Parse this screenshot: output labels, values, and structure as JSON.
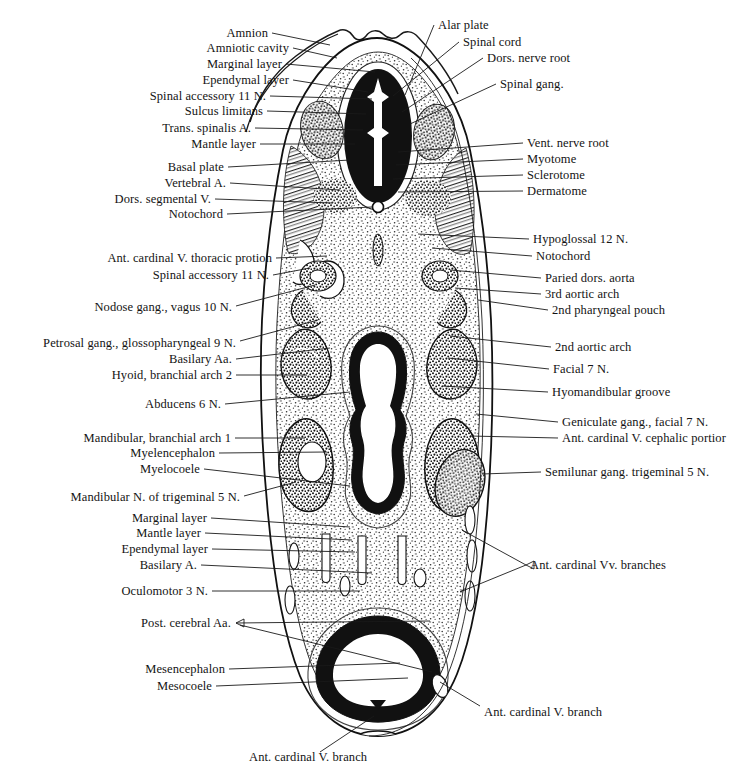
{
  "figure": {
    "type": "anatomical-cross-section",
    "colors": {
      "background": "#ffffff",
      "ink": "#111111",
      "neural_tube_wall": "#151515",
      "mesenchyme_stipple": "#333333"
    }
  },
  "labels": {
    "left": [
      {
        "id": "amnion",
        "text": "Amnion",
        "x": 268,
        "y": 33,
        "lx": 330,
        "ly": 45
      },
      {
        "id": "amniotic-cavity",
        "text": "Amniotic cavity",
        "x": 289,
        "y": 48,
        "lx": 337,
        "ly": 58
      },
      {
        "id": "marginal-layer-1",
        "text": "Marginal layer",
        "x": 282,
        "y": 64,
        "lx": 375,
        "ly": 72
      },
      {
        "id": "ependymal-layer-1",
        "text": "Ependymal layer",
        "x": 289,
        "y": 80,
        "lx": 368,
        "ly": 92
      },
      {
        "id": "spinal-accessory-11n-1",
        "text": "Spinal accessory 11 N.",
        "x": 266,
        "y": 96,
        "lx": 372,
        "ly": 99
      },
      {
        "id": "sulcus-limitans",
        "text": "Sulcus limitans",
        "x": 263,
        "y": 111,
        "lx": 366,
        "ly": 114
      },
      {
        "id": "trans-spinalis-a",
        "text": "Trans. spinalis A.",
        "x": 251,
        "y": 128,
        "lx": 363,
        "ly": 130
      },
      {
        "id": "mantle-layer-1",
        "text": "Mantle layer",
        "x": 256,
        "y": 144,
        "lx": 355,
        "ly": 144
      },
      {
        "id": "basal-plate",
        "text": "Basal plate",
        "x": 224,
        "y": 167,
        "lx": 350,
        "ly": 160
      },
      {
        "id": "vertebral-a",
        "text": "Vertebral A.",
        "x": 226,
        "y": 183,
        "lx": 340,
        "ly": 190
      },
      {
        "id": "dors-segmental-v",
        "text": "Dors. segmental V.",
        "x": 211,
        "y": 199,
        "lx": 332,
        "ly": 203
      },
      {
        "id": "notochord-1",
        "text": "Notochord",
        "x": 223,
        "y": 214,
        "lx": 372,
        "ly": 207
      },
      {
        "id": "ant-cardinal-v-thoracic",
        "text": "Ant. cardinal V. thoracic protion",
        "x": 272,
        "y": 258,
        "lx": 327,
        "ly": 258
      },
      {
        "id": "spinal-accessory-11n-2",
        "text": "Spinal accessory 11 N.",
        "x": 269,
        "y": 275,
        "lx": 320,
        "ly": 276
      },
      {
        "id": "nodose-gang-vagus-10n",
        "text": "Nodose gang., vagus 10 N.",
        "x": 232,
        "y": 308,
        "lx": 315,
        "ly": 285
      },
      {
        "id": "petrosal-gang-9n",
        "text": "Petrosal gang., glossopharyngeal 9 N.",
        "x": 236,
        "y": 343,
        "lx": 315,
        "ly": 330
      },
      {
        "id": "basilary-aa",
        "text": "Basilary Aa.",
        "x": 232,
        "y": 359,
        "lx": 330,
        "ly": 348
      },
      {
        "id": "hyoid-branchial-arch-2",
        "text": "Hyoid, branchial arch 2",
        "x": 232,
        "y": 375,
        "lx": 307,
        "ly": 375
      },
      {
        "id": "abducens-6n",
        "text": "Abducens 6 N.",
        "x": 221,
        "y": 404,
        "lx": 340,
        "ly": 394
      },
      {
        "id": "mandibular-branchial-1",
        "text": "Mandibular, branchial arch 1",
        "x": 231,
        "y": 438,
        "lx": 307,
        "ly": 438
      },
      {
        "id": "myelencephalon",
        "text": "Myelencephalon",
        "x": 215,
        "y": 453,
        "lx": 327,
        "ly": 452
      },
      {
        "id": "myelocoele",
        "text": "Myelocoele",
        "x": 200,
        "y": 469,
        "lx": 350,
        "ly": 486
      },
      {
        "id": "mandibular-n-trig-5n",
        "text": "Mandibular N. of trigeminal 5 N.",
        "x": 240,
        "y": 498,
        "lx": 293,
        "ly": 489
      },
      {
        "id": "marginal-layer-2",
        "text": "Marginal layer",
        "x": 207,
        "y": 518,
        "lx": 350,
        "ly": 527
      },
      {
        "id": "mantle-layer-2",
        "text": "Mantle layer",
        "x": 201,
        "y": 533,
        "lx": 352,
        "ly": 540
      },
      {
        "id": "ependymal-layer-2",
        "text": "Ependymal layer",
        "x": 208,
        "y": 549,
        "lx": 355,
        "ly": 552
      },
      {
        "id": "basilary-a",
        "text": "Basilary A.",
        "x": 197,
        "y": 565,
        "lx": 372,
        "ly": 573
      },
      {
        "id": "oculomotor-3n",
        "text": "Oculomotor 3 N.",
        "x": 208,
        "y": 591,
        "lx": 360,
        "ly": 591
      },
      {
        "id": "post-cerebral-aa",
        "text": "Post. cerebral Aa.",
        "x": 231,
        "y": 623,
        "lx": 430,
        "ly": 621
      },
      {
        "id": "mesencephalon",
        "text": "Mesencephalon",
        "x": 225,
        "y": 669,
        "lx": 395,
        "ly": 669
      },
      {
        "id": "mesocoele",
        "text": "Mesocoele",
        "x": 212,
        "y": 686,
        "lx": 400,
        "ly": 686
      }
    ],
    "right": [
      {
        "id": "alar-plate",
        "text": "Alar plate",
        "x": 438,
        "y": 25,
        "lx": 405,
        "ly": 95
      },
      {
        "id": "spinal-cord",
        "text": "Spinal cord",
        "x": 463,
        "y": 42,
        "lx": 393,
        "ly": 96
      },
      {
        "id": "dors-nerve-root",
        "text": "Dors. nerve root",
        "x": 487,
        "y": 58,
        "lx": 400,
        "ly": 110
      },
      {
        "id": "spinal-gang",
        "text": "Spinal gang.",
        "x": 500,
        "y": 84,
        "lx": 408,
        "ly": 123
      },
      {
        "id": "vent-nerve-root",
        "text": "Vent. nerve root",
        "x": 527,
        "y": 143,
        "lx": 400,
        "ly": 152
      },
      {
        "id": "myotome",
        "text": "Myotome",
        "x": 527,
        "y": 159,
        "lx": 398,
        "ly": 164
      },
      {
        "id": "sclerotome",
        "text": "Sclerotome",
        "x": 527,
        "y": 175,
        "lx": 395,
        "ly": 177
      },
      {
        "id": "dermatome",
        "text": "Dermatome",
        "x": 527,
        "y": 191,
        "lx": 400,
        "ly": 190
      },
      {
        "id": "hypoglossal-12n",
        "text": "Hypoglossal 12 N.",
        "x": 533,
        "y": 239,
        "lx": 420,
        "ly": 236
      },
      {
        "id": "notochord-2",
        "text": "Notochord",
        "x": 536,
        "y": 256,
        "lx": 430,
        "ly": 250
      },
      {
        "id": "paried-dors-aorta",
        "text": "Paried dors. aorta",
        "x": 545,
        "y": 278,
        "lx": 452,
        "ly": 272
      },
      {
        "id": "3rd-aortic-arch",
        "text": "3rd aortic arch",
        "x": 545,
        "y": 294,
        "lx": 455,
        "ly": 288
      },
      {
        "id": "2nd-pharyngeal-pouch",
        "text": "2nd pharyngeal pouch",
        "x": 552,
        "y": 310,
        "lx": 477,
        "ly": 302
      },
      {
        "id": "2nd-aortic-arch",
        "text": "2nd aortic arch",
        "x": 555,
        "y": 347,
        "lx": 450,
        "ly": 337
      },
      {
        "id": "facial-7n",
        "text": "Facial 7 N.",
        "x": 553,
        "y": 369,
        "lx": 445,
        "ly": 360
      },
      {
        "id": "hyomandibular-groove",
        "text": "Hyomandibular groove",
        "x": 552,
        "y": 392,
        "lx": 440,
        "ly": 385
      },
      {
        "id": "geniculate-gang-7n",
        "text": "Geniculate gang., facial 7 N.",
        "x": 562,
        "y": 422,
        "lx": 475,
        "ly": 415
      },
      {
        "id": "ant-cardinal-v-cephalic",
        "text": "Ant. cardinal V. cephalic portior",
        "x": 562,
        "y": 438,
        "lx": 470,
        "ly": 437
      },
      {
        "id": "semilunar-gang-5n",
        "text": "Semilunar gang. trigeminal 5 N.",
        "x": 545,
        "y": 472,
        "lx": 480,
        "ly": 472
      },
      {
        "id": "ant-cardinal-vv-branches",
        "text": "Ant. cardinal Vv. branches",
        "x": 530,
        "y": 565,
        "lx": 455,
        "ly": 532
      }
    ],
    "bottom": [
      {
        "id": "ant-cardinal-v-branch-right",
        "text": "Ant. cardinal V. branch",
        "x": 484,
        "y": 712,
        "lx": 430,
        "ly": 672
      },
      {
        "id": "ant-cardinal-v-branch-bottom",
        "text": "Ant. cardinal V. branch",
        "x": 249,
        "y": 757,
        "lx": 372,
        "ly": 710
      }
    ]
  }
}
